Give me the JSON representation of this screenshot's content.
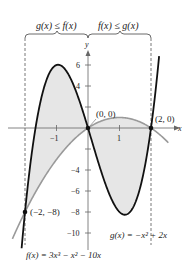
{
  "chart_data": {
    "type": "line",
    "title": "",
    "xlabel": "x",
    "ylabel": "y",
    "xlim": [
      -2.2,
      2.6
    ],
    "ylim": [
      -10.5,
      8
    ],
    "x_ticks": [
      -1,
      1
    ],
    "x_tick_labels": [
      "−1",
      "1"
    ],
    "y_ticks": [
      6,
      4,
      -4,
      -6,
      -8,
      -10
    ],
    "y_tick_labels": [
      "6",
      "4",
      "−4",
      "−6",
      "−8",
      "−10"
    ],
    "grid": false,
    "series": [
      {
        "name": "f(x) = 3x³ − x² − 10x",
        "expression": "3x^3 - x^2 - 10x",
        "color": "#111111",
        "style": "solid-thick"
      },
      {
        "name": "g(x) = −x² + 2x",
        "expression": "-x^2 + 2x",
        "color": "#999999",
        "style": "solid"
      }
    ],
    "intersection_points": [
      {
        "x": -2,
        "y": -8,
        "label": "(−2, −8)"
      },
      {
        "x": 0,
        "y": 0,
        "label": "(0, 0)"
      },
      {
        "x": 2,
        "y": 0,
        "label": "(2, 0)"
      }
    ],
    "shaded_regions": [
      {
        "from": -2,
        "to": 0,
        "between": [
          "g",
          "f"
        ],
        "color": "#e8e8e8"
      },
      {
        "from": 0,
        "to": 2,
        "between": [
          "f",
          "g"
        ],
        "color": "#e8e8e8"
      }
    ],
    "annotations": [
      {
        "text": "g(x) ≤ f(x)",
        "span": [
          -2,
          0
        ]
      },
      {
        "text": "f(x) ≤ g(x)",
        "span": [
          0,
          2
        ]
      }
    ]
  },
  "labels": {
    "region_left": "g(x) ≤ f(x)",
    "region_right": "f(x) ≤ g(x)",
    "axis_x": "x",
    "axis_y": "y",
    "point_origin": "(0, 0)",
    "point_right": "(2, 0)",
    "point_left": "(−2, −8)",
    "tick_x_neg1": "−1",
    "tick_x_1": "1",
    "tick_y_6": "6",
    "tick_y_4": "4",
    "tick_y_neg4": "−4",
    "tick_y_neg6": "−6",
    "tick_y_neg8": "−8",
    "tick_y_neg10": "−10",
    "g_formula": "g(x) = −x² + 2x",
    "f_formula": "f(x) = 3x³ − x² − 10x"
  }
}
